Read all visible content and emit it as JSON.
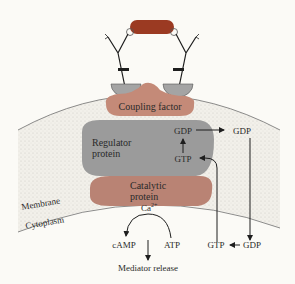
{
  "colors": {
    "background": "#fbfaf6",
    "antigen": "#9b3a22",
    "coupling_factor": "#c48a78",
    "regulator_protein": "#9b9b9b",
    "catalytic_protein": "#b98374",
    "receptor_anchor": "#a4a4a4",
    "membrane_fill": "#e8e6e0",
    "line": "#1e1e1e"
  },
  "labels": {
    "coupling_factor": "Coupling factor",
    "regulator_line1": "Regulator",
    "regulator_line2": "protein",
    "catalytic_line1": "Catalytic",
    "catalytic_line2": "protein",
    "membrane": "Membrane",
    "cytoplasm": "Cytoplasm",
    "calcium": "Ca",
    "calcium_charge": "2+",
    "gdp_inner": "GDP",
    "gtp_inner": "GTP",
    "gdp_outer": "GDP",
    "gtp_bottom": "GTP",
    "gdp_bottom": "GDP",
    "camp": "cAMP",
    "atp": "ATP",
    "mediator_release": "Mediator release"
  }
}
